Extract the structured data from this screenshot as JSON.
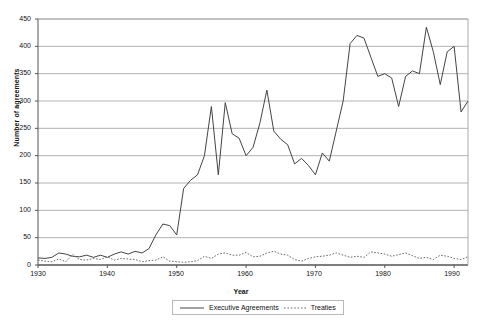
{
  "chart_data": {
    "type": "line",
    "title": "",
    "xlabel": "Year",
    "ylabel": "Number of agreements",
    "xlim": [
      1930,
      1992
    ],
    "ylim": [
      0,
      450
    ],
    "ytick_step": 50,
    "xtick_step": 10,
    "grid": "horizontal",
    "legend_position": "bottom-center",
    "yticks": [
      "450",
      "400",
      "350",
      "300",
      "250",
      "200",
      "150",
      "100",
      "50",
      "0"
    ],
    "xticks": [
      "1930",
      "1940",
      "1950",
      "1960",
      "1970",
      "1980",
      "1990"
    ],
    "x": [
      1930,
      1931,
      1932,
      1933,
      1934,
      1935,
      1936,
      1937,
      1938,
      1939,
      1940,
      1941,
      1942,
      1943,
      1944,
      1945,
      1946,
      1947,
      1948,
      1949,
      1950,
      1951,
      1952,
      1953,
      1954,
      1955,
      1956,
      1957,
      1958,
      1959,
      1960,
      1961,
      1962,
      1963,
      1964,
      1965,
      1966,
      1967,
      1968,
      1969,
      1970,
      1971,
      1972,
      1973,
      1974,
      1975,
      1976,
      1977,
      1978,
      1979,
      1980,
      1981,
      1982,
      1983,
      1984,
      1985,
      1986,
      1987,
      1988,
      1989,
      1990,
      1991,
      1992
    ],
    "series": [
      {
        "name": "Executive Agreements",
        "style": "solid",
        "color": "#444444",
        "values": [
          13,
          12,
          14,
          22,
          20,
          16,
          15,
          18,
          14,
          18,
          14,
          20,
          24,
          20,
          25,
          22,
          30,
          55,
          75,
          72,
          55,
          140,
          155,
          165,
          200,
          290,
          165,
          297,
          240,
          232,
          200,
          215,
          260,
          320,
          245,
          230,
          220,
          185,
          195,
          182,
          165,
          205,
          190,
          245,
          300,
          405,
          420,
          415,
          380,
          345,
          350,
          342,
          290,
          345,
          355,
          350,
          435,
          390,
          330,
          390,
          400,
          280,
          300
        ]
      },
      {
        "name": "Treaties",
        "style": "dotted",
        "color": "#6a6a6a",
        "values": [
          9,
          7,
          6,
          11,
          6,
          19,
          10,
          9,
          12,
          10,
          15,
          9,
          12,
          11,
          10,
          6,
          8,
          9,
          15,
          7,
          6,
          5,
          6,
          8,
          16,
          12,
          20,
          22,
          18,
          18,
          23,
          15,
          16,
          22,
          25,
          20,
          18,
          10,
          7,
          12,
          15,
          16,
          18,
          22,
          18,
          14,
          16,
          14,
          24,
          22,
          20,
          16,
          19,
          22,
          17,
          12,
          14,
          10,
          18,
          16,
          12,
          10,
          15
        ]
      }
    ]
  },
  "legend": {
    "executive_label": "Executive Agreements",
    "treaties_label": "Treaties"
  }
}
